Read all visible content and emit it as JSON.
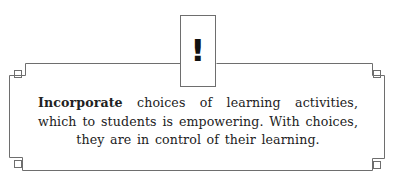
{
  "callout": {
    "icon": "exclamation-icon",
    "icon_glyph": "!",
    "lead_word": "Incorporate",
    "body": " choices of learning activities, which to students is empowering. With choices, they are in control of their learning."
  },
  "colors": {
    "frame_line": "#6e6e6e",
    "text": "#222222",
    "background": "#ffffff"
  }
}
